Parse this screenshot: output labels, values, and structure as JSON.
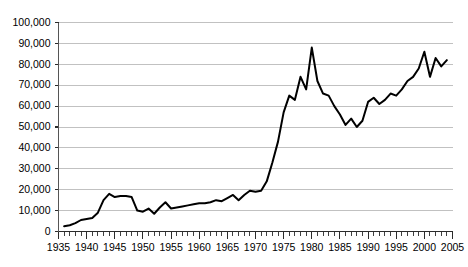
{
  "chart_data": {
    "type": "line",
    "title": "",
    "subtitle": "",
    "xlabel": "",
    "ylabel": "",
    "xlim": [
      1935,
      2005
    ],
    "ylim": [
      0,
      100000
    ],
    "grid": true,
    "legend": false,
    "legend_position": "none",
    "line_color": "#000000",
    "grid_color": "#a6a6a6",
    "axis_color": "#555555",
    "y_ticks": [
      0,
      10000,
      20000,
      30000,
      40000,
      50000,
      60000,
      70000,
      80000,
      90000,
      100000
    ],
    "y_tick_labels": [
      "0",
      "10,000",
      "20,000",
      "30,000",
      "40,000",
      "50,000",
      "60,000",
      "70,000",
      "80,000",
      "90,000",
      "100,000"
    ],
    "x_ticks": [
      1935,
      1940,
      1945,
      1950,
      1955,
      1960,
      1965,
      1970,
      1975,
      1980,
      1985,
      1990,
      1995,
      2000,
      2005
    ],
    "x_tick_labels": [
      "1935",
      "1940",
      "1945",
      "1950",
      "1955",
      "1960",
      "1965",
      "1970",
      "1975",
      "1980",
      "1985",
      "1990",
      "1995",
      "2000",
      "2005"
    ],
    "x_minor_tick_interval": 1,
    "series": [
      {
        "name": "series-1",
        "x": [
          1936,
          1937,
          1938,
          1939,
          1940,
          1941,
          1942,
          1943,
          1944,
          1945,
          1946,
          1947,
          1948,
          1949,
          1950,
          1951,
          1952,
          1953,
          1954,
          1955,
          1956,
          1957,
          1958,
          1959,
          1960,
          1961,
          1962,
          1963,
          1964,
          1965,
          1966,
          1967,
          1968,
          1969,
          1970,
          1971,
          1972,
          1973,
          1974,
          1975,
          1976,
          1977,
          1978,
          1979,
          1980,
          1981,
          1982,
          1983,
          1984,
          1985,
          1986,
          1987,
          1988,
          1989,
          1990,
          1991,
          1992,
          1993,
          1994,
          1995,
          1996,
          1997,
          1998,
          1999,
          2000,
          2001,
          2002,
          2003,
          2004
        ],
        "values": [
          2500,
          3000,
          4000,
          5500,
          6000,
          6500,
          9000,
          15000,
          18000,
          16500,
          17000,
          17000,
          16500,
          10000,
          9500,
          11000,
          8500,
          11500,
          14000,
          11000,
          11500,
          12000,
          12500,
          13000,
          13500,
          13500,
          14000,
          15000,
          14500,
          16000,
          17500,
          15000,
          17500,
          19500,
          19000,
          19500,
          24000,
          33000,
          43000,
          57000,
          65000,
          63000,
          74000,
          68000,
          88000,
          72000,
          66000,
          65000,
          60000,
          56000,
          51000,
          54000,
          50000,
          53000,
          62000,
          64000,
          61000,
          63000,
          66000,
          65000,
          68000,
          72000,
          74000,
          78000,
          86000,
          74000,
          83000,
          79000,
          82000
        ]
      }
    ]
  },
  "axes": {
    "y_axis_name": "value-axis",
    "x_axis_name": "year-axis"
  }
}
